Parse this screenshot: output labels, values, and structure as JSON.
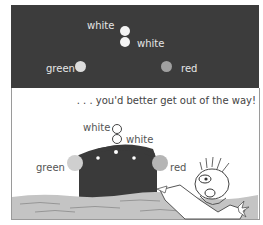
{
  "night_view": {
    "lights": [
      {
        "label": "white",
        "position": "mast-top"
      },
      {
        "label": "white",
        "position": "mast-lower"
      },
      {
        "label": "green",
        "position": "starboard"
      },
      {
        "label": "red",
        "position": "port"
      }
    ],
    "colors": {
      "background": "#3c3c3c",
      "white_light": "#f4f4f4",
      "green_light": "#d9d9d9",
      "red_light": "#9a9a9a"
    }
  },
  "day_view": {
    "caption": ". . . you'd better get out of the way!",
    "lights": [
      {
        "label": "white"
      },
      {
        "label": "white"
      },
      {
        "label": "green"
      },
      {
        "label": "red"
      }
    ],
    "colors": {
      "ship_hull": "#3a3a3a",
      "water": "#c4c4c4",
      "side_light": "#c8c8c8"
    }
  }
}
